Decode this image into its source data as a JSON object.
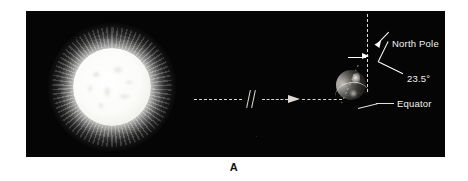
{
  "figure": {
    "caption": "A",
    "background_color": "#ffffff",
    "panel_color": "#050505"
  },
  "scene": {
    "sun": {
      "name": "sun",
      "color": "#ffffff",
      "corona_color": "#d8d8d6"
    },
    "earth": {
      "name": "earth",
      "color": "#5d5b57",
      "axis_tilt_degrees": "23.5"
    },
    "sight_line": {
      "style": "dashed",
      "color": "#d8d6d0",
      "break_symbol": "//",
      "arrow_direction": "right"
    },
    "vertical_reference": {
      "style": "dashed",
      "color": "#dcd9d3"
    }
  },
  "labels": {
    "north_pole": "North Pole",
    "tilt_angle": "23.5°",
    "equator": "Equator"
  }
}
